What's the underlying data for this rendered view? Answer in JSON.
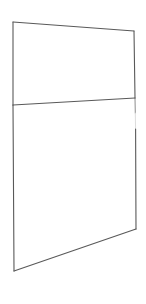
{
  "canvas": {
    "width": 146,
    "height": 304,
    "background_color": "#ffffff",
    "title": "Two-panel quadrilateral line sketch"
  },
  "drawing": {
    "stroke_color": "#595959",
    "stroke_color_light": "#b9b9b9",
    "stroke_width": 1.1,
    "fill_color": "#ffffff",
    "shape_name": "divided-quadrilateral"
  },
  "vertices": {
    "top_left": {
      "x": 13,
      "y": 22
    },
    "top_right": {
      "x": 134,
      "y": 31
    },
    "divider_left": {
      "x": 13,
      "y": 105
    },
    "divider_right": {
      "x": 135,
      "y": 98
    },
    "bottom_left": {
      "x": 14,
      "y": 271
    },
    "bottom_right": {
      "x": 136,
      "y": 229
    }
  },
  "paths": {
    "upper_panel": "M 13 22 L 134 31 L 135 98 L 13 105 Z",
    "lower_panel": "M 13 105 L 135 98 L 136 229 L 14 271 Z",
    "top_edge": "M 13 22 L 134 31",
    "left_edge_upper": "M 13 22 L 13 105",
    "left_edge_lower": "M 13 105 L 14 271",
    "right_edge_upper": "M 134 31 L 135 98",
    "right_edge_lower_a": "M 135 98 L 135.3 113",
    "right_edge_lower_gap": "M 135.3 113 L 135.6 129",
    "right_edge_lower_b": "M 135.6 129 L 136 229",
    "divider": "M 13 105 L 135 98",
    "bottom_edge": "M 14 271 L 136 229"
  },
  "regions": [
    {
      "name": "upper-panel",
      "label": ""
    },
    {
      "name": "lower-panel",
      "label": ""
    }
  ]
}
